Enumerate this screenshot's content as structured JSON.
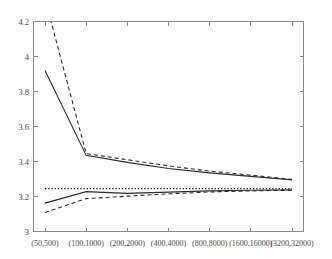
{
  "chart_data": {
    "type": "line",
    "title": "",
    "xlabel": "",
    "ylabel": "",
    "categories": [
      "(50,500)",
      "(100,1000)",
      "(200,2000)",
      "(400,4000)",
      "(800,8000)",
      "(1600,16000)",
      "(3200,32000)"
    ],
    "xtick_labels": [
      "(50,500)",
      "(100,1000)",
      "(200,2000)",
      "(400,4000)",
      "(800,8000)",
      "(1600,16000)",
      "(3200,32000)"
    ],
    "ytick_labels": [
      "3",
      "3.2",
      "3.4",
      "3.6",
      "3.8",
      "4",
      "4.2"
    ],
    "ytick_values": [
      3,
      3.2,
      3.4,
      3.6,
      3.8,
      4,
      4.2
    ],
    "ylim": [
      3.0,
      4.2
    ],
    "xlim": [
      0,
      6
    ],
    "grid": false,
    "legend": "none",
    "line_color": "#2b2b2b",
    "axis_color": "#8a8a8a",
    "series": [
      {
        "name": "upper-solid",
        "style": "solid",
        "values": [
          3.92,
          3.435,
          3.395,
          3.36,
          3.335,
          3.315,
          3.295
        ]
      },
      {
        "name": "upper-dashed",
        "style": "dashed",
        "clipped_above_top": true,
        "values": [
          4.33,
          3.445,
          3.41,
          3.375,
          3.345,
          3.322,
          3.298
        ]
      },
      {
        "name": "lower-solid",
        "style": "solid",
        "values": [
          3.162,
          3.228,
          3.218,
          3.225,
          3.232,
          3.236,
          3.238
        ]
      },
      {
        "name": "lower-dashed",
        "style": "dashed",
        "values": [
          3.108,
          3.188,
          3.202,
          3.215,
          3.226,
          3.232,
          3.236
        ]
      },
      {
        "name": "reference-dotted",
        "style": "dotted",
        "values": [
          3.245,
          3.245,
          3.245,
          3.245,
          3.245,
          3.245,
          3.245
        ]
      }
    ]
  }
}
